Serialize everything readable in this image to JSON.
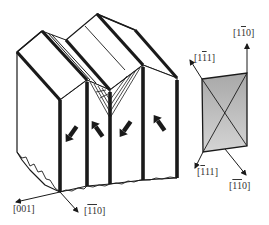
{
  "figure": {
    "colors": {
      "line": "#1a1a1a",
      "inset_fill": "#b8b8b8",
      "background": "#ffffff"
    },
    "axes_main": [
      {
        "id": "axis-001",
        "label": "[001]",
        "overbar_digits": []
      },
      {
        "id": "axis-1b1b0-main",
        "label": "[1̄1̄0]",
        "overbar_digits": [
          0,
          1
        ]
      }
    ],
    "axes_inset": [
      {
        "id": "axis-1-1b-0",
        "label": "[11̄0]",
        "overbar_digits": [
          1
        ]
      },
      {
        "id": "axis-1-1b-1",
        "label": "[11̄1]",
        "overbar_digits": [
          1
        ]
      },
      {
        "id": "axis-1b-1-1",
        "label": "[1̄11]",
        "overbar_digits": [
          0
        ]
      },
      {
        "id": "axis-1b1b0-inset",
        "label": "[1̄1̄0]",
        "overbar_digits": [
          0,
          1
        ]
      }
    ],
    "labels": {
      "main_x": [
        "[",
        "001",
        "]"
      ],
      "main_y": [
        "[",
        "1",
        "1",
        "0",
        "]"
      ],
      "inset_top": [
        "[",
        "1",
        "1",
        "0",
        "]"
      ],
      "inset_topleft": [
        "[",
        "1",
        "1",
        "1",
        "]"
      ],
      "inset_bottomleft": [
        "[",
        "1",
        "11",
        "]"
      ],
      "inset_bottomright": [
        "[",
        "1",
        "1",
        "0",
        "]"
      ]
    },
    "domain_arrows": [
      {
        "id": "arrow-1",
        "direction": "down-left"
      },
      {
        "id": "arrow-2",
        "direction": "up-left"
      },
      {
        "id": "arrow-3",
        "direction": "down-left"
      },
      {
        "id": "arrow-4",
        "direction": "up-left"
      }
    ]
  }
}
